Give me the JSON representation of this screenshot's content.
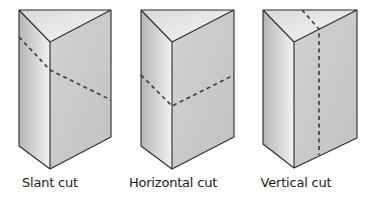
{
  "figure": {
    "colors": {
      "background": "#ffffff",
      "edge": "#2b2b2b",
      "cut_line": "#3a3a3a",
      "top_face_light": "#f7f7f7",
      "top_face_dark": "#d9d9d9",
      "left_face_dark": "#b5b5b5",
      "left_face_light": "#f2f2f2",
      "right_face": "#cbcbcb"
    },
    "prisms": [
      {
        "label": "Slant cut",
        "cut_type": "slant"
      },
      {
        "label": "Horizontal cut",
        "cut_type": "horizontal"
      },
      {
        "label": "Vertical cut",
        "cut_type": "vertical"
      }
    ]
  }
}
